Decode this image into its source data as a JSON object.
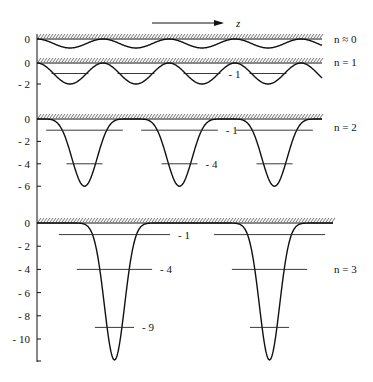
{
  "axis_direction_label": "z",
  "panels": [
    {
      "id": "n0",
      "label": "n ≈ 0",
      "baseline_y": 39,
      "unit_px": 4.5,
      "ticks": [
        "0"
      ],
      "depth": 2,
      "period": 66,
      "x0": 37,
      "x1": 322,
      "shape": "sine",
      "levels": []
    },
    {
      "id": "n1",
      "label": "n = 1",
      "baseline_y": 63,
      "unit_px": 10.5,
      "ticks": [
        "0",
        "- 2"
      ],
      "tick_vals": [
        0,
        -2
      ],
      "depth": 2,
      "period": 66,
      "x0": 37,
      "x1": 322,
      "shape": "sine",
      "levels": [
        {
          "value": -1,
          "label": "- 1",
          "label_index": 2
        }
      ]
    },
    {
      "id": "n2",
      "label": "n = 2",
      "baseline_y": 119,
      "unit_px": 11.2,
      "ticks": [
        "0",
        "- 2",
        "- 4",
        "- 6"
      ],
      "tick_vals": [
        0,
        -2,
        -4,
        -6
      ],
      "depth": 6,
      "period": 95,
      "x0": 37,
      "x1": 322,
      "shape": "well",
      "levels": [
        {
          "value": -1,
          "label": "- 1",
          "label_index": 1
        },
        {
          "value": -4,
          "label": "- 4",
          "label_index": 1
        }
      ]
    },
    {
      "id": "n3",
      "label": "n = 3",
      "baseline_y": 223,
      "unit_px": 11.6,
      "ticks": [
        "0",
        "- 2",
        "- 4",
        "- 6",
        "- 8",
        "- 10"
      ],
      "tick_vals": [
        0,
        -2,
        -4,
        -6,
        -8,
        -10
      ],
      "depth": 11.8,
      "period": 155,
      "x0": 37,
      "x1": 333,
      "shape": "deep",
      "levels": [
        {
          "value": -1,
          "label": "- 1",
          "label_index": 0
        },
        {
          "value": -4,
          "label": "- 4",
          "label_index": 0
        },
        {
          "value": -9,
          "label": "- 9",
          "label_index": 0
        }
      ]
    }
  ],
  "colors": {
    "line": "#111111",
    "hatch": "#333333",
    "level": "#222222"
  }
}
